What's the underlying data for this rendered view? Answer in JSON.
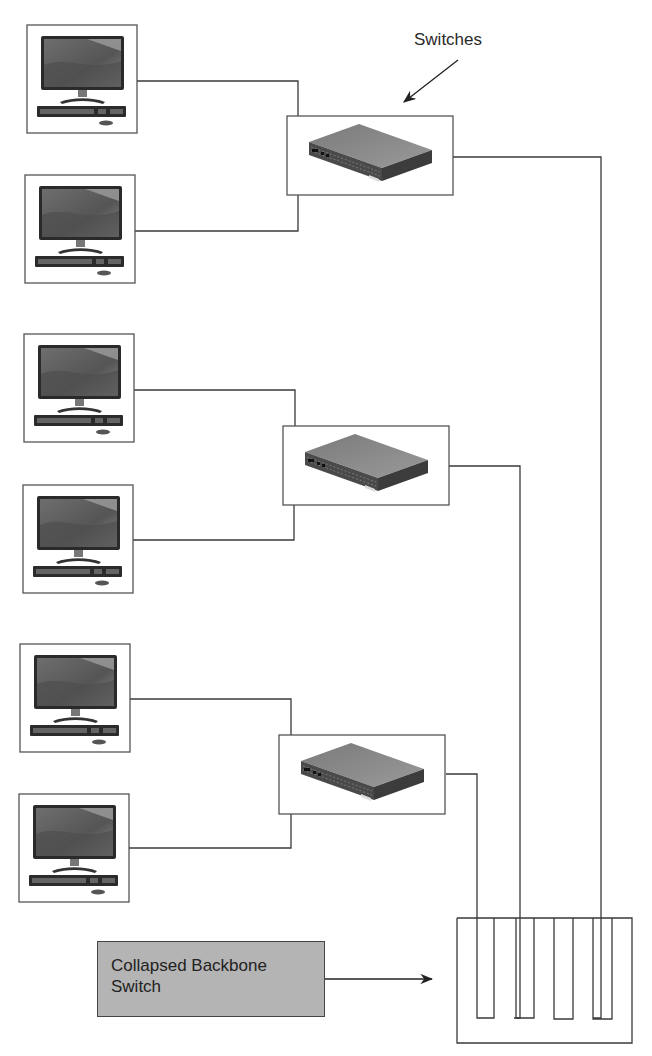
{
  "diagram": {
    "title_label": "Switches",
    "backbone_label": {
      "line1": "Collapsed Backbone",
      "line2": "Switch"
    },
    "colors": {
      "line": "#3a3a3a",
      "label_fill": "#b4b4b4",
      "device_fill": "#5c5c5c",
      "background": "#ffffff"
    },
    "computers": [
      {
        "id": "pc-1",
        "x": 27,
        "y": 25,
        "connects_to": "switch-1"
      },
      {
        "id": "pc-2",
        "x": 25,
        "y": 175,
        "connects_to": "switch-1"
      },
      {
        "id": "pc-3",
        "x": 24,
        "y": 334,
        "connects_to": "switch-2"
      },
      {
        "id": "pc-4",
        "x": 23,
        "y": 485,
        "connects_to": "switch-2"
      },
      {
        "id": "pc-5",
        "x": 20,
        "y": 644,
        "connects_to": "switch-3"
      },
      {
        "id": "pc-6",
        "x": 19,
        "y": 794,
        "connects_to": "switch-3"
      }
    ],
    "switches": [
      {
        "id": "switch-1",
        "x": 287,
        "y": 116,
        "backbone_slot": 4
      },
      {
        "id": "switch-2",
        "x": 283,
        "y": 426,
        "backbone_slot": 2
      },
      {
        "id": "switch-3",
        "x": 279,
        "y": 735,
        "backbone_slot": 1
      }
    ],
    "backbone": {
      "slots": 4
    }
  }
}
